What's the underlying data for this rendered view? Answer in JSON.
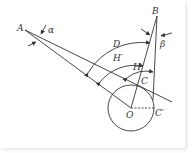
{
  "diagram": {
    "labels": {
      "A": "A",
      "B": "B",
      "alpha": "α",
      "beta": "β",
      "D": "D",
      "H_prime": "H′",
      "H": "H",
      "C": "C",
      "O": "O",
      "C_prime": "C′"
    },
    "points": {
      "A": [
        25,
        30
      ],
      "B": [
        157,
        16
      ],
      "O": [
        131,
        108
      ],
      "C": [
        143,
        84
      ],
      "C_prime": [
        154,
        108
      ]
    },
    "circle": {
      "center": [
        131,
        108
      ],
      "radius": 23
    },
    "colors": {
      "stroke": "#333333",
      "background": "#ffffff"
    }
  }
}
